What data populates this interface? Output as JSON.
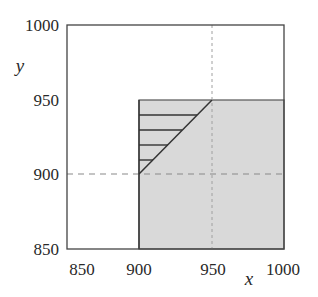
{
  "diagram": {
    "title": "",
    "xaxis": {
      "label": "x",
      "range": [
        850,
        1000
      ],
      "ticks": [
        "850",
        "900",
        "950",
        "1000"
      ]
    },
    "yaxis": {
      "label": "y",
      "range": [
        850,
        1000
      ],
      "ticks": [
        "1000",
        "950",
        "900",
        "850"
      ]
    },
    "regions": {
      "shaded": {
        "description": "shaded rectangle",
        "x_range": [
          900,
          1000
        ],
        "y_range": [
          850,
          950
        ],
        "color": "#d9d9d9"
      },
      "hatched": {
        "description": "hatched triangle above line y = x from (900,900) to (950,950)",
        "vertices": [
          [
            900,
            900
          ],
          [
            950,
            950
          ],
          [
            900,
            950
          ]
        ]
      }
    },
    "reference_lines": {
      "vertical_dashed": {
        "x": 950
      },
      "horizontal_dashed": {
        "y": 900
      }
    },
    "colors": {
      "frame": "#444444",
      "shade": "#d9d9d9",
      "dashed": "#8a8a8a",
      "line": "#333333"
    }
  }
}
